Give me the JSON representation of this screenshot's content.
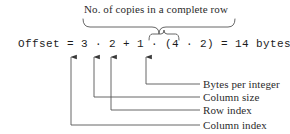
{
  "diagram": {
    "title_caption": "No. of copies in a complete row",
    "equation": "Offset = 3 · 2 + 1 · (4 · 2) = 14 bytes",
    "equation_parts": {
      "lhs": "Offset",
      "equals": "=",
      "row_index": "3",
      "dot1": "·",
      "column_size": "2",
      "plus": "+",
      "column_index": "1",
      "dot2": "·",
      "open_paren": "(",
      "bytes_per_integer": "4",
      "dot3": "·",
      "copies": "2",
      "close_paren": ")",
      "equals2": "=",
      "result_value": "14",
      "result_unit": "bytes"
    },
    "callouts": [
      {
        "label": "Bytes per integer",
        "target": "4"
      },
      {
        "label": "Column size",
        "target": "2"
      },
      {
        "label": "Row index",
        "target": "1"
      },
      {
        "label": "Column index",
        "target": "3"
      }
    ],
    "braces": [
      {
        "name": "complete-row-brace",
        "label": "No. of copies in a complete row"
      },
      {
        "name": "copies-brace",
        "label": ""
      }
    ],
    "colors": {
      "background": "#ffffff",
      "ink": "#2b2b2b",
      "equation_ink": "#1c1c1c",
      "line": "#555555"
    }
  }
}
